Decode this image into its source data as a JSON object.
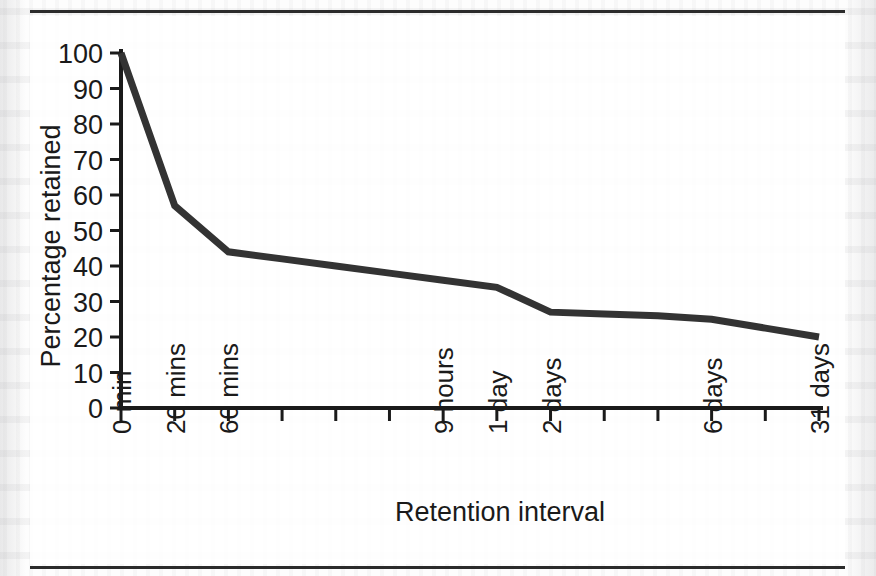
{
  "figure": {
    "kind": "line-chart-figure",
    "has_top_rule": true,
    "has_bottom_rule": true,
    "rule_color": "#2b2b2b",
    "background_color": "#fdfdfd"
  },
  "chart_data": {
    "type": "line",
    "title": "",
    "subtitle": "",
    "xlabel": "Retention interval",
    "ylabel": "Percentage retained",
    "categories": [
      "0 min",
      "20 mins",
      "60 mins",
      "",
      "",
      "",
      "9 hours",
      "1 day",
      "2 days",
      "",
      "",
      "6 days",
      "",
      "31 days"
    ],
    "labeled_categories": [
      "0 min",
      "20 mins",
      "60 mins",
      "9 hours",
      "1 day",
      "2 days",
      "6 days",
      "31 days"
    ],
    "values": [
      100,
      57,
      44,
      42,
      40,
      38,
      36,
      34,
      27,
      26.5,
      26,
      25,
      22.5,
      20
    ],
    "series": [
      {
        "name": "Percentage retained",
        "color": "#333333",
        "values": [
          100,
          57,
          44,
          42,
          40,
          38,
          36,
          34,
          27,
          26.5,
          26,
          25,
          22.5,
          20
        ]
      }
    ],
    "ylim": [
      0,
      100
    ],
    "yticks": [
      0,
      10,
      20,
      30,
      40,
      50,
      60,
      70,
      80,
      90,
      100
    ],
    "ytick_labels": [
      "0",
      "10",
      "20",
      "30",
      "40",
      "50",
      "60",
      "70",
      "80",
      "90",
      "100"
    ],
    "xlim": [
      0,
      13
    ],
    "grid": false,
    "legend": false,
    "legend_position": "none",
    "line_color": "#333333",
    "axis_color": "#1a1a1a"
  }
}
